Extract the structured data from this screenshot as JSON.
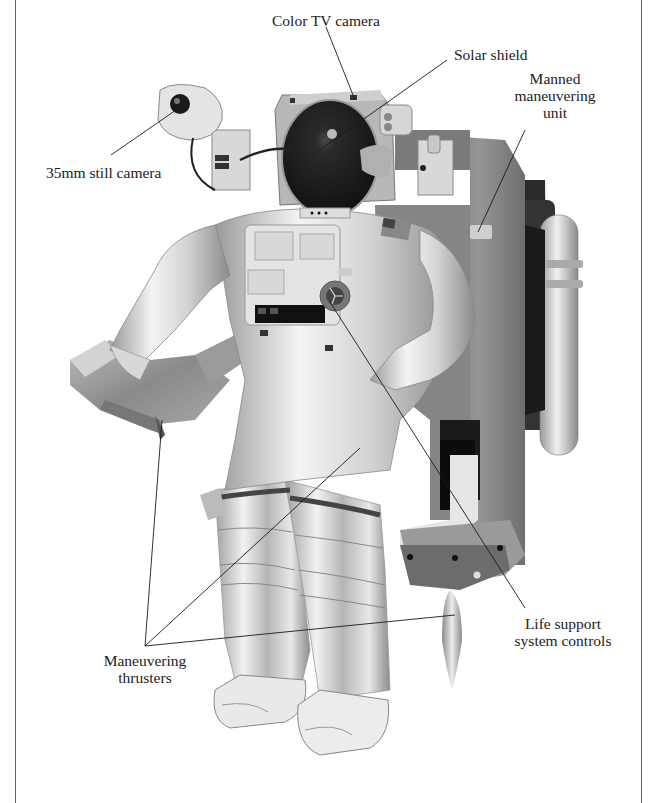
{
  "diagram": {
    "labels": [
      {
        "id": "color-tv-camera",
        "text": [
          "Color TV camera"
        ],
        "anchor": [
          285,
          20
        ],
        "target": [
          355,
          100
        ]
      },
      {
        "id": "solar-shield",
        "text": [
          "Solar shield"
        ],
        "anchor": [
          452,
          55
        ],
        "target": [
          313,
          155
        ]
      },
      {
        "id": "manned-maneuvering-unit",
        "text": [
          "Manned",
          "maneuvering",
          "unit"
        ],
        "anchor": [
          550,
          72
        ],
        "target": [
          478,
          232
        ]
      },
      {
        "id": "35mm-still-camera",
        "text": [
          "35mm still camera"
        ],
        "anchor": [
          108,
          165
        ],
        "target": [
          176,
          110
        ]
      },
      {
        "id": "life-support-system-controls",
        "text": [
          "Life support",
          "system controls"
        ],
        "anchor": [
          530,
          620
        ],
        "target": [
          330,
          305
        ]
      },
      {
        "id": "maneuvering-thrusters",
        "text": [
          "Maneuvering",
          "thrusters"
        ],
        "anchor": [
          115,
          660
        ],
        "targets": [
          [
            160,
            418
          ],
          [
            360,
            445
          ],
          [
            455,
            615
          ]
        ]
      }
    ],
    "colors": {
      "background": "#ffffff",
      "text": "#222222",
      "leader_line": "#1a1a1a",
      "suit_light": "#eeeeee",
      "suit_mid": "#bdbdbd",
      "suit_dark": "#7a7a7a",
      "mmu_face": "#8c8c8c",
      "mmu_dark": "#3a3a3a",
      "visor": "#1c1c1c",
      "border": "#666666"
    }
  }
}
